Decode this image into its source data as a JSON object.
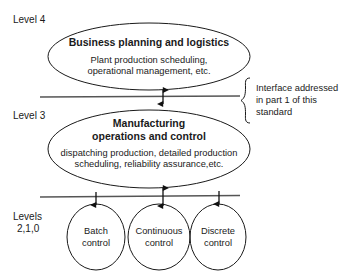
{
  "diagram": {
    "stroke_color": "#1a1a1a",
    "line_color": "#555555",
    "background": "#ffffff",
    "levels": [
      {
        "id": "level4",
        "label": "Level 4"
      },
      {
        "id": "level3",
        "label": "Level 3"
      },
      {
        "id": "levels210",
        "label_line1": "Levels",
        "label_line2": "2,1,0"
      }
    ],
    "ellipses": [
      {
        "id": "business-planning",
        "title": "Business planning and logistics",
        "subtitle_line1": "Plant production scheduling,",
        "subtitle_line2": "operational management, etc."
      },
      {
        "id": "manufacturing-operations",
        "title_line1": "Manufacturing",
        "title_line2": "operations and control",
        "subtitle_line1": "dispatching production, detailed production",
        "subtitle_line2": "scheduling, reliability assurance,etc."
      }
    ],
    "control_nodes": [
      {
        "id": "batch-control",
        "line1": "Batch",
        "line2": "control"
      },
      {
        "id": "continuous-control",
        "line1": "Continuous",
        "line2": "control"
      },
      {
        "id": "discrete-control",
        "line1": "Discrete",
        "line2": "control"
      }
    ],
    "annotation": {
      "id": "interface-note",
      "line1": "Interface addressed",
      "line2": "in part 1 of this",
      "line3": "standard"
    }
  }
}
